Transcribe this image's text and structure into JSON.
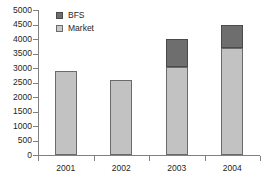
{
  "chart_data": {
    "type": "bar",
    "stacked": true,
    "title": "",
    "xlabel": "",
    "ylabel": "",
    "categories": [
      "2001",
      "2002",
      "2003",
      "2004"
    ],
    "series": [
      {
        "name": "Market",
        "color": "#c2c2c2",
        "values": [
          2900,
          2580,
          3050,
          3700
        ]
      },
      {
        "name": "BFS",
        "color": "#6e6e6e",
        "values": [
          0,
          0,
          950,
          780
        ]
      }
    ],
    "totals": [
      2900,
      2580,
      4000,
      4480
    ],
    "ylim": [
      0,
      5000
    ],
    "ytick_step": 500,
    "yticks": [
      0,
      500,
      1000,
      1500,
      2000,
      2500,
      3000,
      3500,
      4000,
      4500,
      5000
    ],
    "ytick_labels": [
      "0",
      "500",
      "1000",
      "1500",
      "2000",
      "2500",
      "3000",
      "3500",
      "4000",
      "4500",
      "5000"
    ],
    "grid": false,
    "legend": {
      "position": "top-left-inside",
      "entries": [
        {
          "label": "BFS",
          "color": "#6e6e6e"
        },
        {
          "label": "Market",
          "color": "#c9c9c9"
        }
      ]
    },
    "axis_color": "#808080",
    "background": "#ffffff"
  }
}
